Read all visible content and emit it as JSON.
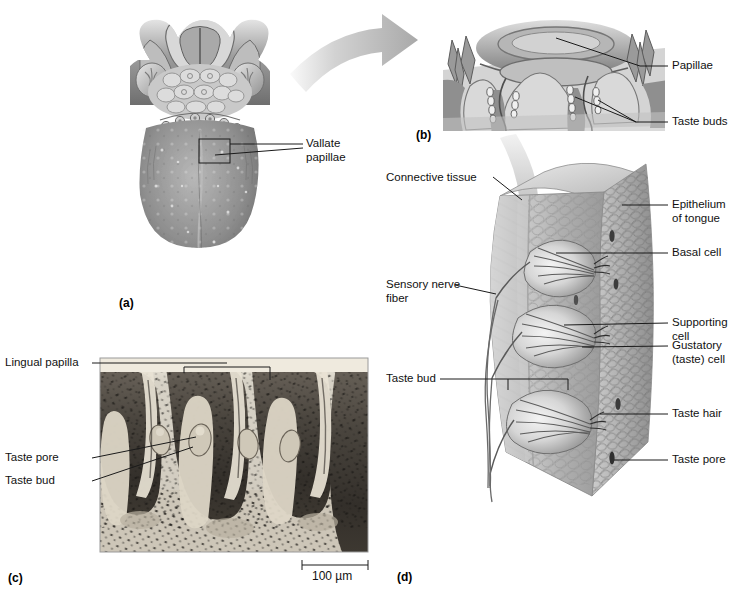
{
  "figure": {
    "background": "#ffffff",
    "panels": [
      {
        "id": "a",
        "letter": "(a)",
        "caption": "Dorsal view of tongue (photograph)"
      },
      {
        "id": "b",
        "letter": "(b)",
        "caption": "Vallate papilla, sectional view"
      },
      {
        "id": "c",
        "letter": "(c)",
        "caption": "Light micrograph of lingual papillae"
      },
      {
        "id": "d",
        "letter": "(d)",
        "caption": "Taste buds within epithelium, 3-D block"
      }
    ]
  },
  "panel_a": {
    "letter": "(a)",
    "labels": [
      {
        "name": "vallate-papillae",
        "text": "Vallate\npapillae",
        "line1": "Vallate",
        "line2": "papillae"
      }
    ]
  },
  "panel_b": {
    "letter": "(b)",
    "labels": [
      {
        "name": "papillae",
        "text": "Papillae"
      },
      {
        "name": "taste-buds",
        "text": "Taste buds"
      }
    ]
  },
  "panel_c": {
    "letter": "(c)",
    "labels": [
      {
        "name": "lingual-papilla",
        "text": "Lingual papilla"
      },
      {
        "name": "taste-pore",
        "text": "Taste pore"
      },
      {
        "name": "taste-bud",
        "text": "Taste bud"
      }
    ],
    "scale_bar": {
      "name": "scale-bar",
      "text": "100 µm",
      "value": 100,
      "unit": "µm"
    }
  },
  "panel_d": {
    "letter": "(d)",
    "labels_left": [
      {
        "name": "connective-tissue",
        "text": "Connective tissue"
      },
      {
        "name": "sensory-nerve-fiber",
        "line1": "Sensory nerve",
        "line2": "fiber"
      },
      {
        "name": "taste-bud",
        "text": "Taste bud"
      }
    ],
    "labels_right": [
      {
        "name": "epithelium-of-tongue",
        "line1": "Epithelium",
        "line2": "of tongue"
      },
      {
        "name": "basal-cell",
        "text": "Basal cell"
      },
      {
        "name": "supporting-cell",
        "line1": "Supporting",
        "line2": "cell"
      },
      {
        "name": "gustatory-taste-cell",
        "line1": "Gustatory",
        "line2": "(taste) cell"
      },
      {
        "name": "taste-hair",
        "text": "Taste hair"
      },
      {
        "name": "taste-pore",
        "text": "Taste pore"
      }
    ]
  },
  "colors": {
    "leader_line": "#1a1a1a",
    "text": "#111111",
    "tissue_light": "#d9d9d9",
    "tissue_mid": "#b4b4b4",
    "tissue_dark": "#8d8d8d",
    "arrow_fill": "#bdbdbd",
    "micrograph_dark": "#3a3a3a",
    "micrograph_light": "#e6e2d8"
  }
}
